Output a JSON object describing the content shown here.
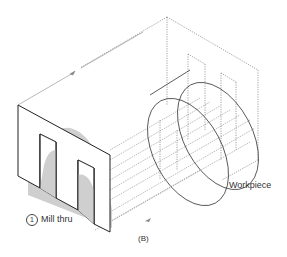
{
  "figure": {
    "caption": "(B)",
    "labels": {
      "step_number": "1",
      "step_text": "Mill thru",
      "workpiece": "Workpiece"
    }
  },
  "colors": {
    "outline": "#222222",
    "dotted": "#555555",
    "shade": "#c8c8c8",
    "text": "#333333"
  }
}
